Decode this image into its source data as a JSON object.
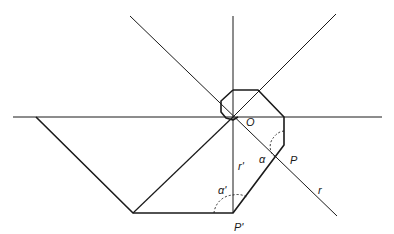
{
  "diagram": {
    "colors": {
      "line": "#1a1a1a",
      "background": "#ffffff"
    },
    "labels": {
      "origin": "O",
      "point_p": "P",
      "point_p_prime": "P'",
      "ray": "r",
      "ray_prime": "r'",
      "angle_alpha": "α",
      "angle_alpha_prime": "α'"
    },
    "points": {
      "O": [
        233,
        117
      ],
      "P": [
        284,
        145
      ],
      "P_prime": [
        233,
        213
      ]
    }
  }
}
